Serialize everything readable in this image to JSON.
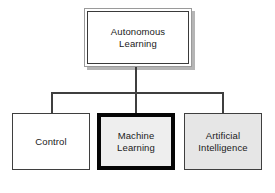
{
  "diagram": {
    "type": "hierarchy-tree",
    "root": {
      "id": "autonomous-learning",
      "label": "Autonomous\nLearning",
      "fill": "#ffffff",
      "border": "#3a3a3a",
      "style": "double-frame-with-shadow"
    },
    "children": [
      {
        "id": "control",
        "label": "Control",
        "fill": "#ffffff",
        "border": "#3f3f3f",
        "style": "thin-border"
      },
      {
        "id": "machine-learning",
        "label": "Machine\nLearning",
        "fill": "#eeeeee",
        "border": "#050505",
        "style": "thick-border-highlighted"
      },
      {
        "id": "artificial-intelligence",
        "label": "Artificial\nIntelligence",
        "fill": "#e6e6e6",
        "border": "#3f3f3f",
        "style": "thin-border-shaded"
      }
    ],
    "connectors": {
      "line_color": "#3f3f3f",
      "root_stem": "vertical",
      "bus": "horizontal",
      "drops": [
        "left",
        "center",
        "right"
      ]
    },
    "background": "#ffffff"
  }
}
